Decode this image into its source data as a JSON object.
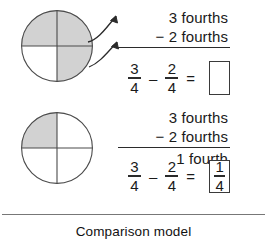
{
  "figure": {
    "caption": "Comparison model",
    "colors": {
      "shaded": "#d2d2d2",
      "stroke": "#4a4a4a",
      "text": "#1a1a1a",
      "divider": "#777777"
    }
  },
  "panels": [
    {
      "id": "top",
      "circle": {
        "name": "fraction-circle-three-fourths",
        "total_parts": 4,
        "shaded_parts": 3,
        "shaded_quadrants": [
          "top-left",
          "top-right",
          "bottom-right"
        ],
        "unshaded_quadrants": [
          "bottom-left"
        ]
      },
      "arrows": {
        "count": 2,
        "direction": "up-right"
      },
      "word_problem": {
        "minuend": "3 fourths",
        "subtrahend": "− 2 fourths",
        "sum": ""
      },
      "equation": {
        "left": {
          "numerator": "3",
          "denominator": "4"
        },
        "operator": "–",
        "right": {
          "numerator": "2",
          "denominator": "4"
        },
        "equals": "=",
        "answer": {
          "filled": false,
          "numerator": "",
          "denominator": ""
        }
      }
    },
    {
      "id": "bottom",
      "circle": {
        "name": "fraction-circle-one-fourth",
        "total_parts": 4,
        "shaded_parts": 1,
        "shaded_quadrants": [
          "top-left"
        ],
        "unshaded_quadrants": [
          "top-right",
          "bottom-left",
          "bottom-right"
        ]
      },
      "arrows": {
        "count": 0,
        "direction": ""
      },
      "word_problem": {
        "minuend": "3 fourths",
        "subtrahend": "− 2 fourths",
        "sum": "1 fourth"
      },
      "equation": {
        "left": {
          "numerator": "3",
          "denominator": "4"
        },
        "operator": "–",
        "right": {
          "numerator": "2",
          "denominator": "4"
        },
        "equals": "=",
        "answer": {
          "filled": true,
          "numerator": "1",
          "denominator": "4"
        }
      }
    }
  ]
}
